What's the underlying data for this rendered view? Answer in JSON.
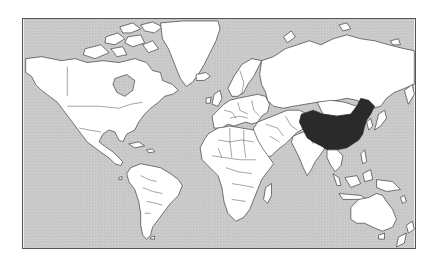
{
  "map": {
    "projection": "Mercator world map",
    "highlighted_country": "China",
    "colors": {
      "ocean": "#c8c8c8",
      "land": "#ffffff",
      "highlight": "#2a2a2a",
      "outline": "#222222",
      "frame": "#555555"
    },
    "regions": [
      {
        "name": "North America",
        "highlighted": false
      },
      {
        "name": "Greenland",
        "highlighted": false
      },
      {
        "name": "South America",
        "highlighted": false
      },
      {
        "name": "Europe",
        "highlighted": false
      },
      {
        "name": "Africa",
        "highlighted": false
      },
      {
        "name": "Russia",
        "highlighted": false
      },
      {
        "name": "Middle East",
        "highlighted": false
      },
      {
        "name": "India",
        "highlighted": false
      },
      {
        "name": "China",
        "highlighted": true
      },
      {
        "name": "Southeast Asia",
        "highlighted": false
      },
      {
        "name": "Japan",
        "highlighted": false
      },
      {
        "name": "Australia",
        "highlighted": false
      },
      {
        "name": "New Zealand",
        "highlighted": false
      },
      {
        "name": "Iceland",
        "highlighted": false
      },
      {
        "name": "Madagascar",
        "highlighted": false
      },
      {
        "name": "United Kingdom",
        "highlighted": false
      }
    ]
  }
}
